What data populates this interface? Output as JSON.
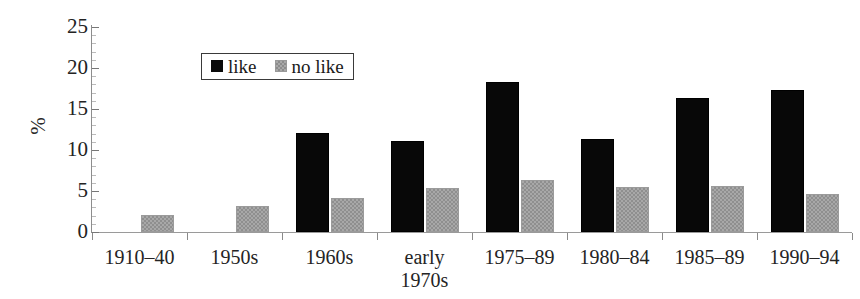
{
  "chart_data": {
    "type": "bar",
    "title": "",
    "xlabel": "",
    "ylabel": "%",
    "ylim": [
      0,
      25
    ],
    "ytick_values": [
      0,
      5,
      10,
      15,
      20,
      25
    ],
    "ytick_labels": [
      "0",
      "5",
      "10",
      "15",
      "20",
      "25"
    ],
    "grid": false,
    "legend_position": "upper-left-inside",
    "categories": [
      "1910–40",
      "1950s",
      "1960s",
      "early\n1970s",
      "1975–89",
      "1980–84",
      "1985–89",
      "1990–94"
    ],
    "series": [
      {
        "name": "like",
        "color": "#0a0a0a",
        "values": [
          null,
          null,
          12.1,
          11.1,
          18.3,
          11.3,
          16.3,
          17.3
        ]
      },
      {
        "name": "no like",
        "color": "#a8a8a8",
        "values": [
          2.1,
          3.2,
          4.1,
          5.4,
          6.3,
          5.5,
          5.6,
          4.6
        ]
      }
    ]
  },
  "legend": {
    "entries": [
      {
        "label": "like",
        "swatch": "like-swatch"
      },
      {
        "label": "no like",
        "swatch": "no-like-swatch"
      }
    ]
  },
  "axes": {
    "y_axis_label": "%"
  }
}
